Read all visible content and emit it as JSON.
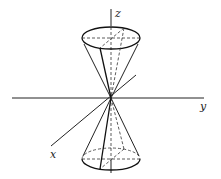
{
  "diagram": {
    "type": "3d-double-cone",
    "axes": {
      "x": {
        "label": "x"
      },
      "y": {
        "label": "y"
      },
      "z": {
        "label": "z"
      }
    },
    "shapes": [
      {
        "name": "upper-nappe",
        "kind": "cone"
      },
      {
        "name": "lower-nappe",
        "kind": "cone"
      }
    ]
  }
}
